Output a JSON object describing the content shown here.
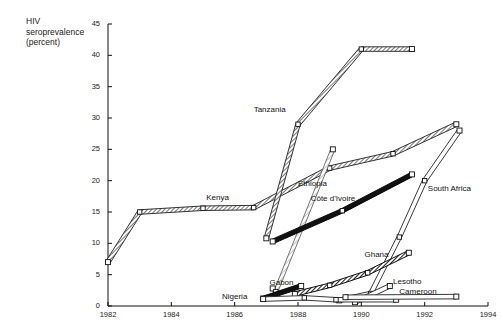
{
  "chart_data": {
    "type": "line",
    "title": "HIV\nseroprevalence\n(percent)",
    "ylabel": "HIV seroprevalence (percent)",
    "xlabel": "",
    "xlim": [
      1982,
      1994
    ],
    "ylim": [
      0,
      45
    ],
    "grid": false,
    "legend_position": "inline-labels",
    "xticks": [
      "1982",
      "1984",
      "1986",
      "1988",
      "1990",
      "1992",
      "1994"
    ],
    "yticks": [
      "0",
      "5",
      "10",
      "15",
      "20",
      "25",
      "30",
      "35",
      "40",
      "45"
    ],
    "series": [
      {
        "name": "Kenya",
        "label_x": 1985.1,
        "label_y": 17.3,
        "style": "gray-band",
        "points": [
          [
            1982,
            7.0
          ],
          [
            1983,
            15.0
          ],
          [
            1985,
            15.6
          ],
          [
            1986.6,
            15.7
          ],
          [
            1989,
            22.0
          ],
          [
            1991,
            24.3
          ],
          [
            1993,
            29.0
          ]
        ]
      },
      {
        "name": "Tanzania",
        "label_x": 1986.6,
        "label_y": 31.2,
        "style": "gray-band",
        "points": [
          [
            1987,
            10.8
          ],
          [
            1988,
            29.0
          ],
          [
            1990,
            41.0
          ],
          [
            1991.6,
            41.0
          ]
        ]
      },
      {
        "name": "Ethiopia",
        "label_x": 1988.0,
        "label_y": 19.5,
        "style": "light-band",
        "points": [
          [
            1987.2,
            2.8
          ],
          [
            1987.3,
            2.3
          ],
          [
            1989.1,
            25.0
          ]
        ]
      },
      {
        "name": "Côte d'Ivoire",
        "label_x": 1988.4,
        "label_y": 17.0,
        "style": "black-band",
        "points": [
          [
            1987.2,
            10.3
          ],
          [
            1989.4,
            15.2
          ],
          [
            1991.6,
            21.0
          ]
        ]
      },
      {
        "name": "South Africa",
        "label_x": 1992.1,
        "label_y": 18.6,
        "style": "outline-band",
        "points": [
          [
            1989.3,
            0.9
          ],
          [
            1990.3,
            2.0
          ],
          [
            1991.2,
            11.0
          ],
          [
            1992.0,
            20.0
          ],
          [
            1993.1,
            28.0
          ]
        ]
      },
      {
        "name": "Ghana",
        "label_x": 1990.1,
        "label_y": 8.2,
        "style": "dark-band",
        "points": [
          [
            1987.9,
            1.9
          ],
          [
            1989.0,
            3.3
          ],
          [
            1990.2,
            5.3
          ],
          [
            1991.5,
            8.5
          ]
        ]
      },
      {
        "name": "Gabon",
        "label_x": 1987.1,
        "label_y": 3.6,
        "style": "black-band",
        "points": [
          [
            1986.9,
            1.2
          ],
          [
            1988.1,
            3.2
          ]
        ]
      },
      {
        "name": "Lesotho",
        "label_x": 1991.0,
        "label_y": 3.9,
        "style": "outline-band",
        "points": [
          [
            1989.8,
            0.6
          ],
          [
            1990.9,
            3.2
          ]
        ]
      },
      {
        "name": "Nigeria",
        "label_x": 1985.6,
        "label_y": 1.5,
        "style": "outline-band",
        "points": [
          [
            1986.9,
            1.1
          ],
          [
            1988.2,
            1.3
          ],
          [
            1989.2,
            1.0
          ],
          [
            1991.1,
            1.0
          ]
        ]
      },
      {
        "name": "Cameroon",
        "label_x": 1991.2,
        "label_y": 2.2,
        "style": "outline-band",
        "points": [
          [
            1989.5,
            1.4
          ],
          [
            1993.0,
            1.5
          ]
        ]
      }
    ]
  }
}
